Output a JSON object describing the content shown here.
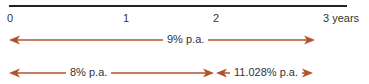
{
  "timeline": {
    "ticks": [
      {
        "label": "0",
        "x": 9
      },
      {
        "label": "1",
        "x": 125
      },
      {
        "label": "2",
        "x": 215
      },
      {
        "label": "3 years",
        "x": 325
      }
    ]
  },
  "arrows": {
    "color": "#b2522a",
    "rate_3yr": {
      "label": "9% p.a.",
      "from": 0,
      "to": 3
    },
    "rate_2yr": {
      "label": "8% p.a.",
      "from": 0,
      "to": 2
    },
    "rate_forward": {
      "label": "11.028% p.a.",
      "from": 2,
      "to": 3
    }
  }
}
